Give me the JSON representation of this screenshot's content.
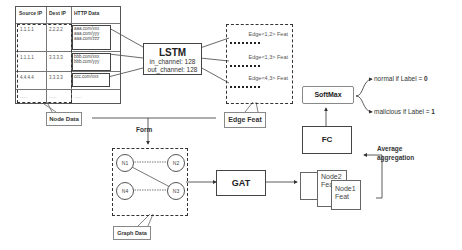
{
  "table": {
    "headers": [
      "Source IP",
      "Dest IP",
      "HTTP Data"
    ],
    "rows": [
      {
        "src": "1.1.1.1",
        "dst": "2.2.2.2",
        "urls": [
          "aaa.com/xxx",
          "aaa.com/yyy",
          "aaa.com/zzz"
        ]
      },
      {
        "src": "1.1.1.1",
        "dst": "3.3.3.3",
        "urls": [
          "bbb.com/xxx",
          "bbb.com/yyy"
        ]
      },
      {
        "src": "4.4.4.4",
        "dst": "3.3.3.3",
        "urls": [
          "ccc.com/xxx"
        ]
      },
      {
        "src": "......",
        "dst": "......",
        "urls": [
          "......"
        ]
      }
    ],
    "callout": "Node Data"
  },
  "lstm": {
    "title": "LSTM",
    "in_channel": "in_channel: 128",
    "out_channel": "out_channel: 128"
  },
  "edge_feat": {
    "items": [
      "Edge<1,2> Feat",
      "Edge<1,3> Feat",
      "Edge<4,3> Feat"
    ],
    "callout": "Edge Feat"
  },
  "form_label": "Form",
  "graph": {
    "nodes": [
      "N1",
      "N2",
      "N4",
      "N3"
    ],
    "callout": "Graph Data"
  },
  "gat": {
    "title": "GAT"
  },
  "node_feats": [
    {
      "line1": "Node2",
      "line2": "Feat"
    },
    {
      "line1": "Node1",
      "line2": "Feat"
    }
  ],
  "aggregation_label": [
    "Average",
    "aggregation"
  ],
  "fc": {
    "title": "FC"
  },
  "softmax": {
    "title": "SoftMax"
  },
  "outputs": {
    "normal": "normal if Label = ",
    "normal_val": "0",
    "malicious": "malicious if Label = ",
    "malicious_val": "1"
  }
}
